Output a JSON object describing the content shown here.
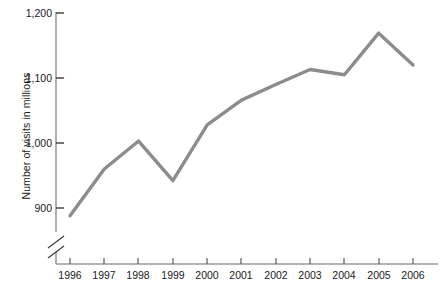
{
  "chart_data": {
    "type": "line",
    "title": "",
    "xlabel": "",
    "ylabel": "Number of visits in millions",
    "categories": [
      "1996",
      "1997",
      "1998",
      "1999",
      "2000",
      "2001",
      "2002",
      "2003",
      "2004",
      "2005",
      "2006"
    ],
    "values": [
      888,
      960,
      1003,
      942,
      1028,
      1066,
      1090,
      1113,
      1105,
      1169,
      1120
    ],
    "series": [
      {
        "name": "Number of visits in millions",
        "values": [
          888,
          960,
          1003,
          942,
          1028,
          1066,
          1090,
          1113,
          1105,
          1169,
          1120
        ]
      }
    ],
    "ylim": [
      860,
      1200
    ],
    "ytick_values": [
      900,
      1000,
      1100,
      1200
    ],
    "ytick_labels": [
      "900",
      "1,000",
      "1,100",
      "1,200"
    ],
    "xtick_labels": [
      "1996",
      "1997",
      "1998",
      "1999",
      "2000",
      "2001",
      "2002",
      "2003",
      "2004",
      "2005",
      "2006"
    ],
    "axis_break": true,
    "grid": false,
    "legend": "none",
    "line_color": "#8c8c8c",
    "axis_color": "#9a9a9a",
    "text_color": "#1a1a1a"
  },
  "labels": {
    "y_axis_title": "Number of visits in millions",
    "y_1200": "1,200",
    "y_1100": "1,100",
    "y_1000": "1,000",
    "y_900": "900",
    "x_1996": "1996",
    "x_1997": "1997",
    "x_1998": "1998",
    "x_1999": "1999",
    "x_2000": "2000",
    "x_2001": "2001",
    "x_2002": "2002",
    "x_2003": "2003",
    "x_2004": "2004",
    "x_2005": "2005",
    "x_2006": "2006"
  }
}
